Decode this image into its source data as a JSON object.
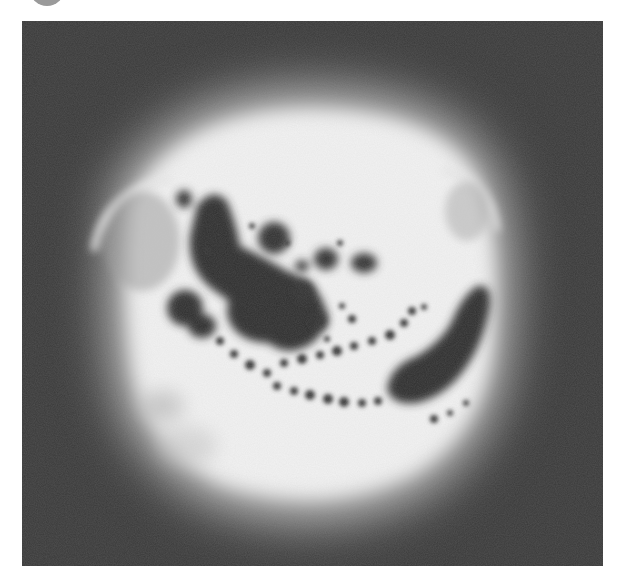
{
  "image": {
    "subject": "grayscale image of a bright solar disc with dark sunspot groups",
    "colors": {
      "page_background": "#ffffff",
      "frame_background": "#3a3a3a",
      "disc_core": "#f4f4f4",
      "disc_halo": "#bdbdbd",
      "sunspot_dark": "#2e2e2e",
      "corner_circle": "#9a9a9a"
    }
  }
}
